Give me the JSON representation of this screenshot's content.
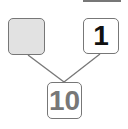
{
  "diagram": {
    "type": "number-bond",
    "parts": [
      {
        "position": "top-left",
        "value": "",
        "blank": true
      },
      {
        "position": "top-right",
        "value": "1"
      }
    ],
    "whole": {
      "position": "bottom",
      "value": "10"
    }
  }
}
